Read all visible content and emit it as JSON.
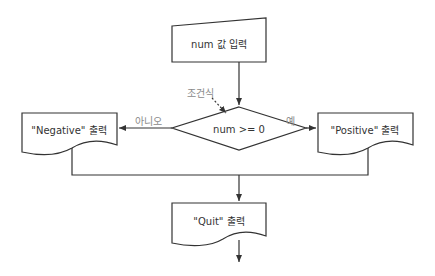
{
  "diagram": {
    "type": "flowchart",
    "colors": {
      "line": "#333333",
      "label_gray": "#8a8a8a",
      "background": "#ffffff"
    },
    "nodes": {
      "input": {
        "shape": "manual-input",
        "label": "num 값 입력"
      },
      "condition": {
        "shape": "decision",
        "label": "num >= 0",
        "annotation": "조건식"
      },
      "negative": {
        "shape": "document",
        "label": "\"Negative\" 출력"
      },
      "positive": {
        "shape": "document",
        "label": "\"Positive\" 출력"
      },
      "quit": {
        "shape": "document",
        "label": "\"Quit\" 출력"
      }
    },
    "edges": {
      "no_label": "아니오",
      "yes_label": "예"
    }
  }
}
